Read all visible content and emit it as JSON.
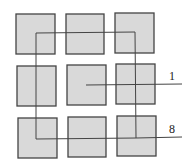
{
  "diagram": {
    "colors": {
      "square_fill": "#d9d9d9",
      "square_stroke": "#444444",
      "line": "#444444"
    },
    "squares": [
      {
        "x": 16,
        "y": 14,
        "w": 39,
        "h": 40
      },
      {
        "x": 66,
        "y": 14,
        "w": 38,
        "h": 40
      },
      {
        "x": 115,
        "y": 13,
        "w": 39,
        "h": 40
      },
      {
        "x": 17,
        "y": 66,
        "w": 39,
        "h": 40
      },
      {
        "x": 67,
        "y": 65,
        "w": 39,
        "h": 40
      },
      {
        "x": 116,
        "y": 64,
        "w": 39,
        "h": 40
      },
      {
        "x": 18,
        "y": 118,
        "w": 39,
        "h": 40
      },
      {
        "x": 68,
        "y": 117,
        "w": 38,
        "h": 40
      },
      {
        "x": 117,
        "y": 116,
        "w": 39,
        "h": 40
      }
    ],
    "labels": [
      {
        "text": "1",
        "x": 169,
        "y": 80
      },
      {
        "text": "8",
        "x": 169,
        "y": 133
      }
    ]
  }
}
